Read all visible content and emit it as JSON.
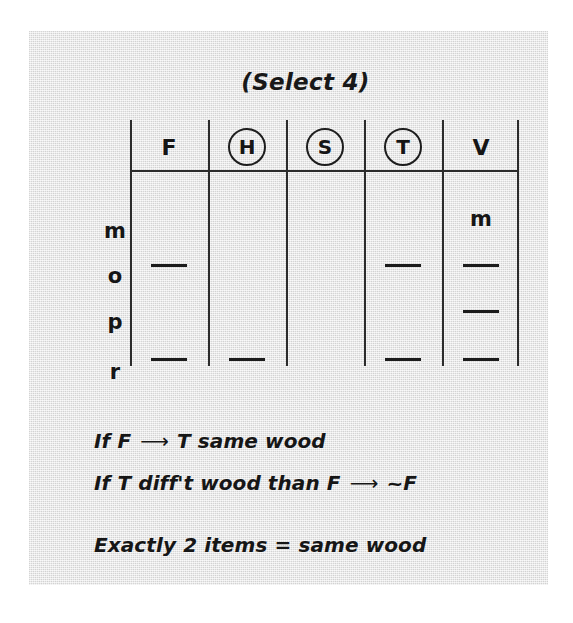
{
  "page": {
    "title": "(Select 4)",
    "background_color": "#ffffff",
    "panel_color": "#e8e8e8",
    "ink_color": "#1b1b1b"
  },
  "grid": {
    "columns": [
      {
        "label": "F",
        "circled": false
      },
      {
        "label": "H",
        "circled": true
      },
      {
        "label": "S",
        "circled": true
      },
      {
        "label": "T",
        "circled": true
      },
      {
        "label": "V",
        "circled": false
      }
    ],
    "row_labels": [
      "m",
      "o",
      "p",
      "r"
    ],
    "cells": [
      {
        "row": "m",
        "F": "",
        "H": "",
        "S": "",
        "T": "",
        "V": "m"
      },
      {
        "row": "o",
        "F": "—",
        "H": "",
        "S": "",
        "T": "—",
        "V": "—"
      },
      {
        "row": "p",
        "F": "",
        "H": "",
        "S": "",
        "T": "",
        "V": "—"
      },
      {
        "row": "r",
        "F": "—",
        "H": "—",
        "S": "",
        "T": "—",
        "V": "—"
      }
    ]
  },
  "rules": {
    "rule1": {
      "before": "If F",
      "arrow": "⟶",
      "after": "T same wood"
    },
    "rule2": {
      "before": "If T diff't wood than F",
      "arrow": "⟶",
      "after": "~F"
    },
    "rule3": {
      "text": "Exactly 2 items = same wood"
    }
  }
}
